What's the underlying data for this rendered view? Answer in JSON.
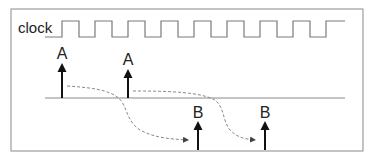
{
  "diagram": {
    "clock_label": "clock",
    "events_top": [
      {
        "label": "A",
        "x": 62
      },
      {
        "label": "A",
        "x": 128
      }
    ],
    "events_bottom": [
      {
        "label": "B",
        "x": 198
      },
      {
        "label": "B",
        "x": 265
      }
    ],
    "colors": {
      "frame": "#8a8a8a",
      "clock": "#7a7a7a",
      "baseline": "#8a8a8a",
      "arrow": "#111111",
      "dashed": "#888888",
      "text": "#222222"
    }
  }
}
